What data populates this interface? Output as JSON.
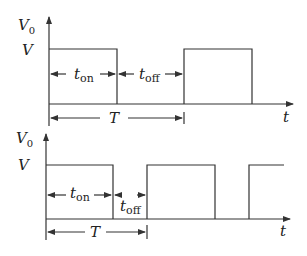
{
  "diagram": {
    "type": "pwm-waveforms",
    "top": {
      "y_axis_label": "V",
      "y_axis_sub": "0",
      "level_label": "V",
      "x_axis_label": "t",
      "ton_label": "t",
      "ton_sub": "on",
      "toff_label": "t",
      "toff_sub": "off",
      "period_label": "T"
    },
    "bottom": {
      "y_axis_label": "V",
      "y_axis_sub": "0",
      "level_label": "V",
      "x_axis_label": "t",
      "ton_label": "t",
      "ton_sub": "on",
      "toff_label": "t",
      "toff_sub": "off",
      "period_label": "T"
    },
    "line_color": "#333333"
  }
}
